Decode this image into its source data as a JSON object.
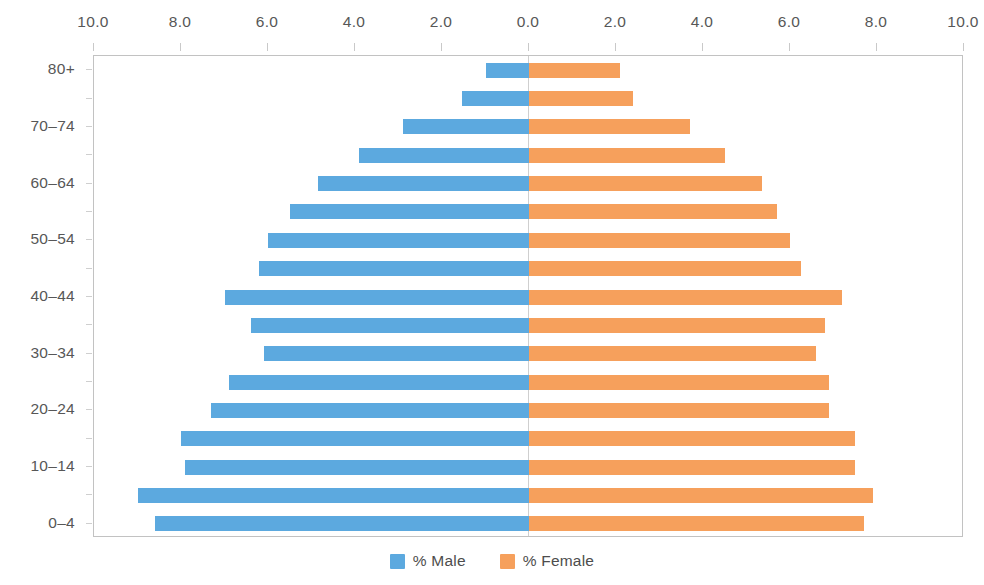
{
  "chart_data": {
    "type": "bar",
    "subtype": "population-pyramid",
    "title": "",
    "xlabel": "",
    "ylabel": "",
    "orientation": "horizontal",
    "diverging": true,
    "grid": false,
    "legend_position": "bottom-center",
    "xlim": [
      -10.0,
      10.0
    ],
    "xtick_labels": [
      "10.0",
      "8.0",
      "6.0",
      "4.0",
      "2.0",
      "0.0",
      "2.0",
      "4.0",
      "6.0",
      "8.0",
      "10.0"
    ],
    "xtick_values": [
      -10,
      -8,
      -6,
      -4,
      -2,
      0,
      2,
      4,
      6,
      8,
      10
    ],
    "categories": [
      "80+",
      "75–79",
      "70–74",
      "65–69",
      "60–64",
      "55–59",
      "50–54",
      "45–49",
      "40–44",
      "35–39",
      "30–34",
      "25–29",
      "20–24",
      "15–19",
      "10–14",
      "5–9",
      "0–4"
    ],
    "visible_category_labels": [
      "80+",
      "",
      "70–74",
      "",
      "60–64",
      "",
      "50–54",
      "",
      "40–44",
      "",
      "30–34",
      "",
      "20–24",
      "",
      "10–14",
      "",
      "0–4"
    ],
    "series": [
      {
        "name": "% Male",
        "color": "#5CA9DF",
        "direction": "left",
        "values": [
          1.0,
          1.55,
          2.9,
          3.9,
          4.85,
          5.5,
          6.0,
          6.2,
          7.0,
          6.4,
          6.1,
          6.9,
          7.3,
          8.0,
          7.9,
          9.0,
          8.6
        ]
      },
      {
        "name": "% Female",
        "color": "#F6A05C",
        "direction": "right",
        "values": [
          2.1,
          2.4,
          3.7,
          4.5,
          5.35,
          5.7,
          6.0,
          6.25,
          7.2,
          6.8,
          6.6,
          6.9,
          6.9,
          7.5,
          7.5,
          7.9,
          7.7
        ]
      }
    ]
  },
  "legend": {
    "items": [
      {
        "label": "% Male",
        "color": "#5CA9DF",
        "icon": "square-swatch-icon"
      },
      {
        "label": "% Female",
        "color": "#F6A05C",
        "icon": "square-swatch-icon"
      }
    ]
  }
}
